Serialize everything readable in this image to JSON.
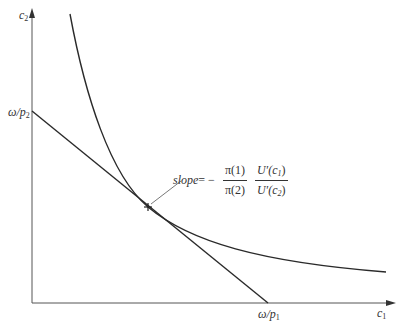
{
  "diagram": {
    "axes": {
      "x_label": "c",
      "x_label_sub": "1",
      "y_label": "c",
      "y_label_sub": "2"
    },
    "intercepts": {
      "y_intercept_label": "ω/p",
      "y_intercept_sub": "2",
      "x_intercept_label": "ω/p",
      "x_intercept_sub": "1"
    },
    "annotation": {
      "slope_word": "slope",
      "equals_minus": " = −",
      "frac1_num": "π(1)",
      "frac1_den": "π(2)",
      "frac2_num_prefix": "U′(c",
      "frac2_num_sub": "1",
      "frac2_den_prefix": "U′(c",
      "frac2_den_sub": "2",
      "close_paren": ")"
    },
    "colors": {
      "curve": "#2a2a2a",
      "axis": "#555555",
      "text": "#333333"
    }
  }
}
